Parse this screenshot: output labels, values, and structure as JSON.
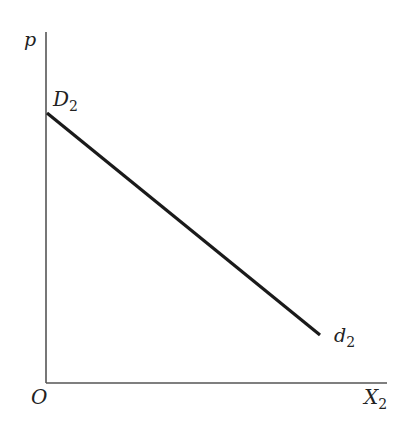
{
  "diagram": {
    "type": "demand-curve",
    "axes": {
      "y_label": "p",
      "x_label": "X",
      "x_label_sub": "2",
      "origin_label": "O"
    },
    "curve": {
      "start_label": "D",
      "start_label_sub": "2",
      "end_label": "d",
      "end_label_sub": "2",
      "color": "#1a1a1a"
    },
    "colors": {
      "axis": "#555555",
      "background": "#ffffff"
    }
  }
}
